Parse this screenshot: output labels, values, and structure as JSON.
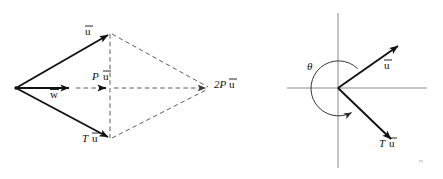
{
  "figure": {
    "background_color": "#ffffff",
    "ink_color": "#111111",
    "dashed_color": "#4a4a4a",
    "axis_color": "#8a8a8a",
    "panels": [
      {
        "id": "left-panel",
        "name": "parallelogram-diagram",
        "description": "Rhombus formed by vectors u-bar and T u-bar from a common left vertex, with projection P u-bar along the horizontal and resultant 2P u-bar at the right vertex.",
        "labels": {
          "u_bar": "u",
          "u_bar_overline": true,
          "w_bar": "w",
          "w_bar_overline": true,
          "p_u_bar_prefix": "P",
          "p_u_bar_main": "u",
          "two_p_u_bar_prefix": "2P",
          "two_p_u_bar_main": "u",
          "t_u_bar_prefix": "T",
          "t_u_bar_main": "u"
        },
        "geometry": {
          "left_vertex": [
            16,
            88
          ],
          "top_vertex": [
            110,
            33
          ],
          "right_vertex": [
            210,
            88
          ],
          "bottom_vertex": [
            110,
            139
          ],
          "w_arrow_tip": [
            74,
            88
          ],
          "p_u_arrow_tip": [
            110,
            88
          ]
        }
      },
      {
        "id": "right-panel",
        "name": "angle-diagram",
        "description": "Cartesian axes with vector u-bar in the first quadrant, vector T u-bar in the fourth quadrant, and a reflex arc labelled theta swept counterclockwise between them.",
        "labels": {
          "theta": "θ",
          "u_bar": "u",
          "u_bar_overline": true,
          "t_u_bar_prefix": "T",
          "t_u_bar_main": "u"
        },
        "geometry": {
          "origin": [
            338,
            88
          ],
          "x_axis": [
            287,
            427
          ],
          "y_axis": [
            13,
            168
          ],
          "u_vector_tip": [
            401,
            44
          ],
          "t_u_vector_tip": [
            394,
            142
          ],
          "arc_radius": 28
        }
      }
    ]
  }
}
